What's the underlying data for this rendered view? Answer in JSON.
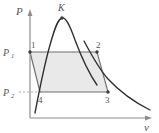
{
  "figure": {
    "type": "pressure-volume-diagram",
    "background_color": "#ffffff"
  },
  "axes": {
    "y_label": "P",
    "x_label": "v",
    "axis_color": "#8c8c8c",
    "y_axis": {
      "x": 30,
      "top": 12,
      "bottom": 118
    },
    "x_axis": {
      "y": 118,
      "left": 30,
      "right": 152
    }
  },
  "pressure_levels": [
    {
      "id": "p1",
      "label": "P",
      "subscript": "1",
      "y": 52
    },
    {
      "id": "p2",
      "label": "P",
      "subscript": "2",
      "y": 92
    }
  ],
  "critical_point": {
    "label": "K",
    "x": 62,
    "y": 18,
    "marker_color": "#3c3c3c"
  },
  "state_points": [
    {
      "label": "1",
      "x": 30,
      "y": 52
    },
    {
      "label": "2",
      "x": 97,
      "y": 52
    },
    {
      "label": "3",
      "x": 108,
      "y": 92
    },
    {
      "label": "4",
      "x": 40,
      "y": 92
    }
  ],
  "cycle_region": {
    "fill_color": "#e9e9e9",
    "stroke_color": "#7a7a7a",
    "vertices": "30,52 97,52 108,92 40,92"
  },
  "saturation_dome": {
    "stroke_color": "#2e2e2e",
    "description": "vapor dome through critical point K"
  },
  "isotherm": {
    "stroke_color": "#2e2e2e",
    "description": "isotherm descending to the right"
  },
  "leader_line": {
    "stroke_color": "#9a9a9a",
    "style": "dashed",
    "from_x": 18,
    "to_x": 40,
    "y": 92
  },
  "colors": {
    "curve": "#2e2e2e",
    "axis": "#8c8c8c",
    "fill": "#e9e9e9",
    "text": "#555555",
    "marker": "#3c3c3c"
  }
}
